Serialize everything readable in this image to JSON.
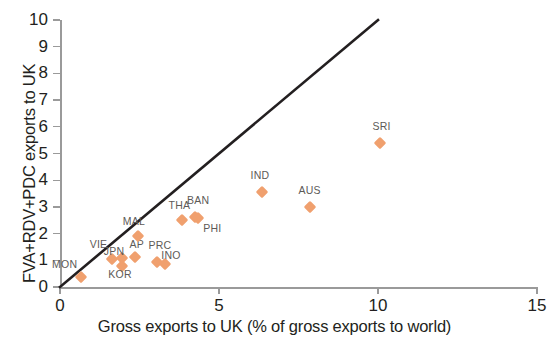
{
  "chart_data": {
    "type": "scatter",
    "title": "",
    "xlabel": "Gross exports to UK (% of gross exports to world)",
    "ylabel": "FVA+RDV+PDC exports to UK",
    "xlim": [
      0,
      15
    ],
    "ylim": [
      0,
      10
    ],
    "xticks": [
      "0",
      "5",
      "10",
      "15"
    ],
    "xtick_values": [
      0,
      5,
      10,
      15
    ],
    "yticks": [
      "0",
      "1",
      "2",
      "3",
      "4",
      "5",
      "6",
      "7",
      "8",
      "9",
      "10"
    ],
    "ytick_values": [
      0,
      1,
      2,
      3,
      4,
      5,
      6,
      7,
      8,
      9,
      10
    ],
    "grid": false,
    "legend": "none",
    "marker_color": "#f0a06e",
    "marker_shape": "diamond",
    "annotations": [
      {
        "name": "forty-five-degree-line",
        "description": "45 degree reference line from origin",
        "from": [
          0,
          0
        ],
        "to": [
          10,
          10
        ],
        "color": "#231f20"
      }
    ],
    "points": [
      {
        "label": "MON",
        "x": 0.65,
        "y": 0.38,
        "label_dx": -16,
        "label_dy": -18
      },
      {
        "label": "VIE",
        "x": 1.65,
        "y": 1.05,
        "label_dx": -14,
        "label_dy": -20
      },
      {
        "label": "JPN",
        "x": 1.95,
        "y": 1.08,
        "label_dx": -8,
        "label_dy": -12
      },
      {
        "label": "KOR",
        "x": 1.95,
        "y": 0.78,
        "label_dx": -2,
        "label_dy": 3
      },
      {
        "label": "AP",
        "x": 2.35,
        "y": 1.12,
        "label_dx": 2,
        "label_dy": -18
      },
      {
        "label": "MAL",
        "x": 2.45,
        "y": 1.92,
        "label_dx": -4,
        "label_dy": -20
      },
      {
        "label": "PRC",
        "x": 3.05,
        "y": 0.92,
        "label_dx": 3,
        "label_dy": -22
      },
      {
        "label": "INO",
        "x": 3.3,
        "y": 0.88,
        "label_dx": 6,
        "label_dy": -14
      },
      {
        "label": "THA",
        "x": 3.85,
        "y": 2.52,
        "label_dx": -3,
        "label_dy": -20
      },
      {
        "label": "BAN",
        "x": 4.25,
        "y": 2.62,
        "label_dx": 3,
        "label_dy": -22
      },
      {
        "label": "PHI",
        "x": 4.35,
        "y": 2.58,
        "label_dx": 14,
        "label_dy": 5
      },
      {
        "label": "IND",
        "x": 6.35,
        "y": 3.55,
        "label_dx": -2,
        "label_dy": -22
      },
      {
        "label": "AUS",
        "x": 7.85,
        "y": 2.98,
        "label_dx": 0,
        "label_dy": -22
      },
      {
        "label": "SRI",
        "x": 10.05,
        "y": 5.38,
        "label_dx": 2,
        "label_dy": -22
      }
    ]
  }
}
